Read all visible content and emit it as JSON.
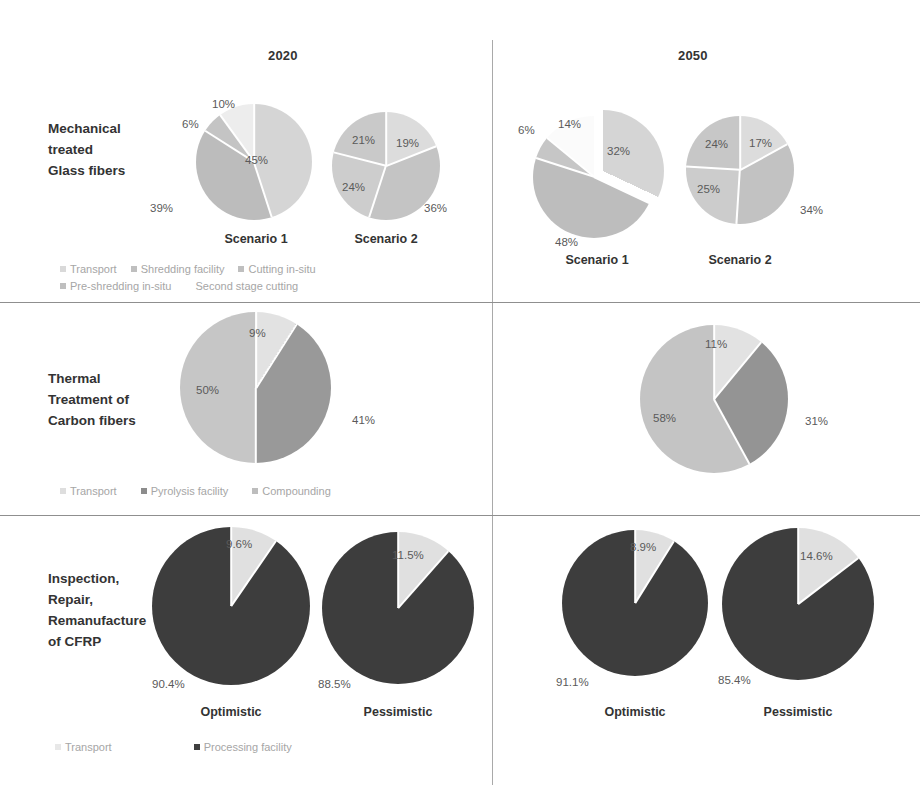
{
  "figure": {
    "background": "#ffffff",
    "column_headers": [
      {
        "label": "2020"
      },
      {
        "label": "2050"
      }
    ],
    "row_labels": [
      {
        "lines": [
          "Mechanical",
          "treated",
          "Glass fibers"
        ]
      },
      {
        "lines": [
          "Thermal",
          "Treatment of",
          "Carbon fibers"
        ]
      },
      {
        "lines": [
          "Inspection,",
          "Repair,",
          "Remanufacture",
          "of CFRP"
        ]
      }
    ]
  },
  "palette": {
    "transport": "#d9d9d9",
    "shredding_facility": "#bfbfbf",
    "cutting_in_situ": "#f2f2f2",
    "pre_shredding_in_situ": "#c9c9c9",
    "second_stage_cutting": "#d0d0d0",
    "pyrolysis_facility": "#8c8c8c",
    "compounding": "#c0c0c0",
    "processing_facility": "#3f3f3f",
    "divider": "#8f8f8f",
    "label_text": "#5a5a5a",
    "legend_text": "#a6a6a6"
  },
  "legends": {
    "row1": {
      "line1": [
        {
          "label": "Transport",
          "color": "#d9d9d9"
        },
        {
          "label": "Shredding facility",
          "color": "#bfbfbf"
        },
        {
          "label": "Cutting in-situ",
          "color": "#bfbfbf"
        }
      ],
      "line2": [
        {
          "label": "Pre-shredding in-situ",
          "color": "#bfbfbf"
        },
        {
          "label": "Second stage cutting",
          "color": "#ffffff"
        }
      ]
    },
    "row2": {
      "line1": [
        {
          "label": "Transport",
          "color": "#d9d9d9"
        },
        {
          "label": "Pyrolysis facility",
          "color": "#8c8c8c"
        },
        {
          "label": "Compounding",
          "color": "#bdbdbd"
        }
      ]
    },
    "row3": {
      "line1": [
        {
          "label": "Transport",
          "color": "#e0e0e0"
        },
        {
          "label": "Processing facility",
          "color": "#3f3f3f"
        }
      ]
    }
  },
  "chart_data": [
    {
      "id": "glass-2020-s1",
      "type": "pie",
      "title": "Scenario 1",
      "row": "Mechanical treated Glass fibers",
      "column": "2020",
      "categories": [
        "Transport",
        "Shredding facility",
        "Cutting in-situ",
        "Pre-shredding in-situ"
      ],
      "labels": [
        "45%",
        "39%",
        "6%",
        "10%"
      ],
      "values": [
        45,
        39,
        6,
        10
      ],
      "colors": [
        "#d5d5d5",
        "#bcbcbc",
        "#c4c4c4",
        "#ededed"
      ],
      "exploded": false
    },
    {
      "id": "glass-2020-s2",
      "type": "pie",
      "title": "Scenario 2",
      "row": "Mechanical treated Glass fibers",
      "column": "2020",
      "categories": [
        "Transport",
        "Shredding facility",
        "Pre-shredding in-situ",
        "Second stage cutting"
      ],
      "labels": [
        "19%",
        "36%",
        "24%",
        "21%"
      ],
      "values": [
        19,
        36,
        24,
        21
      ],
      "colors": [
        "#dcdcdc",
        "#c4c4c4",
        "#cdcdcd",
        "#c9c9c9"
      ],
      "exploded": false
    },
    {
      "id": "glass-2050-s1",
      "type": "pie",
      "title": "Scenario 1",
      "row": "Mechanical treated Glass fibers",
      "column": "2050",
      "categories": [
        "Transport",
        "Shredding facility",
        "Cutting in-situ",
        "Pre-shredding in-situ"
      ],
      "labels": [
        "32%",
        "48%",
        "6%",
        "14%"
      ],
      "values": [
        32,
        48,
        6,
        14
      ],
      "colors": [
        "#d5d5d5",
        "#bdbdbd",
        "#c6c6c6",
        "#fbfbfb"
      ],
      "exploded": true
    },
    {
      "id": "glass-2050-s2",
      "type": "pie",
      "title": "Scenario 2",
      "row": "Mechanical treated Glass fibers",
      "column": "2050",
      "categories": [
        "Transport",
        "Shredding facility",
        "Pre-shredding in-situ",
        "Second stage cutting"
      ],
      "labels": [
        "17%",
        "34%",
        "25%",
        "24%"
      ],
      "values": [
        17,
        34,
        25,
        24
      ],
      "colors": [
        "#dcdcdc",
        "#c2c2c2",
        "#cccccc",
        "#c7c7c7"
      ],
      "exploded": false
    },
    {
      "id": "carbon-2020",
      "type": "pie",
      "row": "Thermal Treatment of Carbon fibers",
      "column": "2020",
      "title": "",
      "categories": [
        "Transport",
        "Pyrolysis facility",
        "Compounding"
      ],
      "labels": [
        "9%",
        "41%",
        "50%"
      ],
      "values": [
        9,
        41,
        50
      ],
      "colors": [
        "#e2e2e2",
        "#999999",
        "#c6c6c6"
      ],
      "exploded": false
    },
    {
      "id": "carbon-2050",
      "type": "pie",
      "row": "Thermal Treatment of Carbon fibers",
      "column": "2050",
      "title": "",
      "categories": [
        "Transport",
        "Pyrolysis facility",
        "Compounding"
      ],
      "labels": [
        "11%",
        "31%",
        "58%"
      ],
      "values": [
        11,
        31,
        58
      ],
      "colors": [
        "#e2e2e2",
        "#949494",
        "#c4c4c4"
      ],
      "exploded": false
    },
    {
      "id": "cfrp-2020-opt",
      "type": "pie",
      "row": "Inspection, Repair, Remanufacture of CFRP",
      "column": "2020",
      "title": "Optimistic",
      "categories": [
        "Transport",
        "Processing facility"
      ],
      "labels": [
        "9.6%",
        "90.4%"
      ],
      "values": [
        9.6,
        90.4
      ],
      "colors": [
        "#e0e0e0",
        "#3d3d3d"
      ],
      "exploded": false
    },
    {
      "id": "cfrp-2020-pes",
      "type": "pie",
      "row": "Inspection, Repair, Remanufacture of CFRP",
      "column": "2020",
      "title": "Pessimistic",
      "categories": [
        "Transport",
        "Processing facility"
      ],
      "labels": [
        "11.5%",
        "88.5%"
      ],
      "values": [
        11.5,
        88.5
      ],
      "colors": [
        "#e0e0e0",
        "#3d3d3d"
      ],
      "exploded": false
    },
    {
      "id": "cfrp-2050-opt",
      "type": "pie",
      "row": "Inspection, Repair, Remanufacture of CFRP",
      "column": "2050",
      "title": "Optimistic",
      "categories": [
        "Transport",
        "Processing facility"
      ],
      "labels": [
        "8.9%",
        "91.1%"
      ],
      "values": [
        8.9,
        91.1
      ],
      "colors": [
        "#e0e0e0",
        "#3d3d3d"
      ],
      "exploded": false
    },
    {
      "id": "cfrp-2050-pes",
      "type": "pie",
      "row": "Inspection, Repair, Remanufacture of CFRP",
      "column": "2050",
      "title": "Pessimistic",
      "categories": [
        "Transport",
        "Processing facility"
      ],
      "labels": [
        "14.6%",
        "85.4%"
      ],
      "values": [
        14.6,
        85.4
      ],
      "colors": [
        "#e0e0e0",
        "#3d3d3d"
      ],
      "exploded": false
    }
  ],
  "captions": {
    "glass_2020_s1": "Scenario 1",
    "glass_2020_s2": "Scenario 2",
    "glass_2050_s1": "Scenario 1",
    "glass_2050_s2": "Scenario 2",
    "cfrp_2020_opt": "Optimistic",
    "cfrp_2020_pes": "Pessimistic",
    "cfrp_2050_opt": "Optimistic",
    "cfrp_2050_pes": "Pessimistic"
  },
  "value_labels": {
    "glass_2020_s1": {
      "a": "45%",
      "b": "39%",
      "c": "6%",
      "d": "10%"
    },
    "glass_2020_s2": {
      "a": "19%",
      "b": "36%",
      "c": "24%",
      "d": "21%"
    },
    "glass_2050_s1": {
      "a": "32%",
      "b": "48%",
      "c": "6%",
      "d": "14%"
    },
    "glass_2050_s2": {
      "a": "17%",
      "b": "34%",
      "c": "25%",
      "d": "24%"
    },
    "carbon_2020": {
      "a": "9%",
      "b": "41%",
      "c": "50%"
    },
    "carbon_2050": {
      "a": "11%",
      "b": "31%",
      "c": "58%"
    },
    "cfrp_2020_opt": {
      "a": "9.6%",
      "b": "90.4%"
    },
    "cfrp_2020_pes": {
      "a": "11.5%",
      "b": "88.5%"
    },
    "cfrp_2050_opt": {
      "a": "8.9%",
      "b": "91.1%"
    },
    "cfrp_2050_pes": {
      "a": "14.6%",
      "b": "85.4%"
    }
  }
}
